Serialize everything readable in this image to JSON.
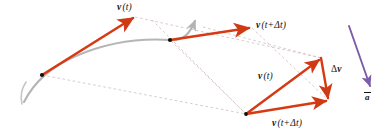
{
  "figure": {
    "background": "#ffffff",
    "width": 388,
    "height": 135
  },
  "colors": {
    "velocity_vector": "#d73a13",
    "trajectory": "#b3b3b3",
    "construction_line": "#c0a0a0",
    "acceleration_vector": "#7b5ea7",
    "point_marker": "#000000",
    "label_text": "#141414"
  },
  "labels": {
    "v_t_upper": {
      "vector": "v",
      "arg": "(t)",
      "x": 117,
      "y": 4
    },
    "v_t_dt_upper": {
      "vector": "v",
      "arg": "(t+Δt)",
      "x": 256,
      "y": 22
    },
    "v_t_triangle": {
      "vector": "v",
      "arg": "(t)",
      "x": 258,
      "y": 73
    },
    "v_t_dt_triangle": {
      "vector": "v",
      "arg": "(t+Δt)",
      "x": 272,
      "y": 120
    },
    "delta_v": {
      "vector": "v",
      "arg": "",
      "prefix": "Δ",
      "x": 331,
      "y": 66
    },
    "a_avg": {
      "vector": "a",
      "arg": "",
      "x": 364,
      "y": 93
    }
  },
  "elements": {
    "trajectory_curve": "gray curved path of the particle with arrowhead at the end",
    "point_t": "black dot marking position at time t",
    "point_t_dt": "black dot marking position at time t+Δt",
    "velocity_at_t": "red arrow tangent to curve at time t",
    "velocity_at_t_dt": "red arrow tangent to curve at time t+Δt",
    "triangle_v_t": "red arrow v(t) of the vector triangle",
    "triangle_v_t_dt": "red arrow v(t+Δt) of the vector triangle",
    "triangle_delta_v": "red arrow Δv closing the vector triangle",
    "average_acceleration": "purple arrow showing average acceleration direction",
    "construction_lines": "dashed translation lines linking trajectory vectors to the vector triangle"
  },
  "geometry": {
    "trajectory": "M 26,100 C 34,84 48,68 74,56 C 104,42 140,38 172,40 C 186,41 192,34 197,20",
    "trajectory_arrow": "M 197,20 L 194.2,27.4 L 201.3,24.6 Z",
    "point_t": {
      "cx": 42,
      "cy": 75,
      "r": 2.0
    },
    "point_t_dt": {
      "cx": 170,
      "cy": 40,
      "r": 2.0
    },
    "vel_t_line": {
      "x1": 42,
      "y1": 75,
      "x2": 135,
      "y2": 17
    },
    "vel_t_dt_line": {
      "x1": 170,
      "y1": 40,
      "x2": 251,
      "y2": 28
    },
    "tri_apex": {
      "x": 246,
      "y": 114
    },
    "tri_top": {
      "x": 321,
      "y": 58
    },
    "tri_right": {
      "x": 328,
      "y": 100
    },
    "accel_line": {
      "x1": 348,
      "y1": 26,
      "x2": 370,
      "y2": 88
    },
    "dashes": [
      "M 42,75 L 246,114",
      "M 135,17 L 321,58",
      "M 170,40 L 246,114",
      "M 251,28 L 328,100",
      "M 171,16 L 246,114",
      "M 196,22 L 321,58"
    ]
  }
}
